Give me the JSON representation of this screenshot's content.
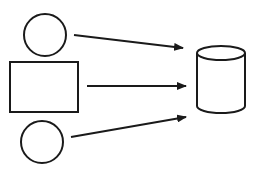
{
  "diagram": {
    "title": "",
    "stroke_color": "#1a1a1a",
    "background": "#ffffff",
    "nodes": [
      {
        "id": "circle-top",
        "shape": "circle",
        "label": ""
      },
      {
        "id": "rectangle-middle",
        "shape": "rectangle",
        "label": ""
      },
      {
        "id": "circle-bottom",
        "shape": "circle",
        "label": ""
      },
      {
        "id": "database",
        "shape": "cylinder",
        "label": ""
      }
    ],
    "edges": [
      {
        "from": "circle-top",
        "to": "database",
        "type": "arrow"
      },
      {
        "from": "rectangle-middle",
        "to": "database",
        "type": "arrow"
      },
      {
        "from": "circle-bottom",
        "to": "database",
        "type": "arrow"
      }
    ]
  }
}
